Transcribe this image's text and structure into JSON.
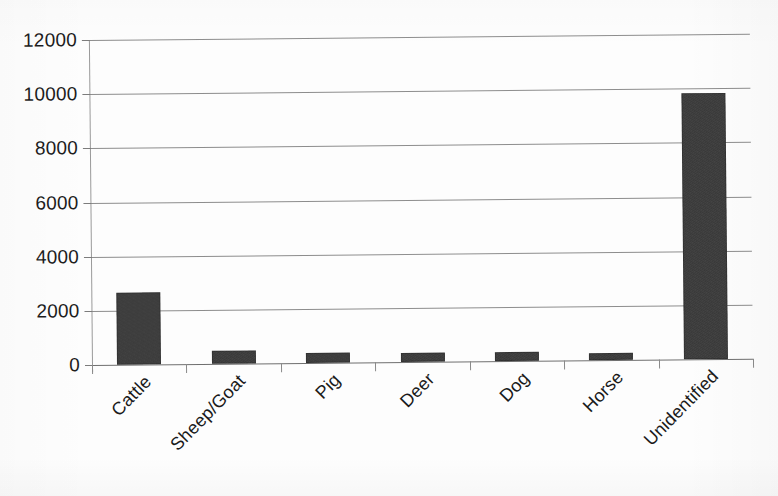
{
  "chart_data": {
    "type": "bar",
    "title": "",
    "subtitle": "",
    "xlabel": "",
    "ylabel": "",
    "categories": [
      "Cattle",
      "Sheep/Goat",
      "Pig",
      "Deer",
      "Dog",
      "Horse",
      "Unidentified"
    ],
    "values": [
      2660,
      480,
      370,
      330,
      330,
      250,
      9820
    ],
    "ylim": [
      0,
      12000
    ],
    "y_ticks": [
      0,
      2000,
      4000,
      6000,
      8000,
      10000,
      12000
    ],
    "y_tick_labels": [
      "0",
      "2000",
      "4000",
      "6000",
      "8000",
      "10000",
      "12000"
    ],
    "grid": true,
    "legend": null,
    "legend_position": "none",
    "bar_color": "#3c3c3c",
    "gridline_color": "#8d8d8d",
    "axis_color": "#9a9a9a",
    "background_color": "#fdfdfd",
    "x_tick_label_rotation": -45,
    "series": [
      {
        "name": "Specimen count",
        "values": [
          2660,
          480,
          370,
          330,
          330,
          250,
          9820
        ]
      }
    ]
  }
}
